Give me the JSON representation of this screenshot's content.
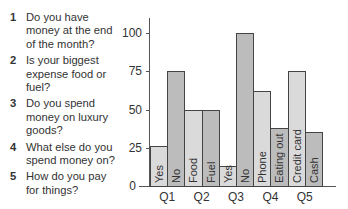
{
  "questions": [
    {
      "num": "1",
      "text": "Do you have money at the end of the month?"
    },
    {
      "num": "2",
      "text": "Is your biggest expense food or fuel?"
    },
    {
      "num": "3",
      "text": "Do you spend money on luxury goods?"
    },
    {
      "num": "4",
      "text": "What else do you spend money on?"
    },
    {
      "num": "5",
      "text": "How do you pay for things?"
    }
  ],
  "chart_data": {
    "type": "bar",
    "title": "",
    "xlabel": "",
    "ylabel": "",
    "ylim": [
      0,
      100
    ],
    "yticks": [
      "0",
      "25",
      "50",
      "75",
      "100"
    ],
    "grid": false,
    "categories": [
      "Q1",
      "Q2",
      "Q3",
      "Q4",
      "Q5"
    ],
    "bars": [
      {
        "group": "Q1",
        "label": "Yes",
        "value": 26
      },
      {
        "group": "Q1",
        "label": "No",
        "value": 75
      },
      {
        "group": "Q2",
        "label": "Food",
        "value": 50
      },
      {
        "group": "Q2",
        "label": "Fuel",
        "value": 50
      },
      {
        "group": "Q3",
        "label": "Yes",
        "value": 13
      },
      {
        "group": "Q3",
        "label": "No",
        "value": 100
      },
      {
        "group": "Q4",
        "label": "Phone",
        "value": 62
      },
      {
        "group": "Q4",
        "label": "Eating out",
        "value": 38
      },
      {
        "group": "Q5",
        "label": "Credit card",
        "value": 75
      },
      {
        "group": "Q5",
        "label": "Cash",
        "value": 35
      }
    ]
  }
}
